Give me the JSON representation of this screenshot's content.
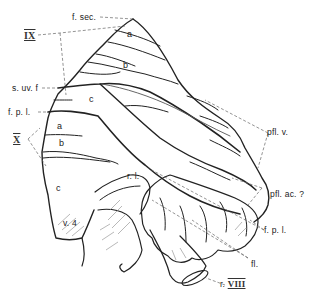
{
  "figure": {
    "type": "anatomical line drawing"
  },
  "labels": {
    "f_sec": "f. sec.",
    "IX": "IX",
    "s_uv_f": "s. uv. f",
    "f_p_l_left": "f. p. l.",
    "X": "X",
    "pfl_v": "pfl. v.",
    "pfl_ac": "pfl. ac. ?",
    "f_p_l_right": "f. p. l.",
    "fl": "fl.",
    "r_VIII_prefix": "r.",
    "r_VIII_numeral": "VIII",
    "r_l": "r. l.",
    "v_4": "v. 4"
  },
  "lobules": {
    "IX_a": "a",
    "IX_b": "b",
    "IX_c": "c",
    "X_a": "a",
    "X_b": "b",
    "X_c": "c"
  },
  "colors": {
    "ink": "#222222",
    "light_ink": "#777777",
    "leader": "#666666",
    "background": "#ffffff"
  }
}
